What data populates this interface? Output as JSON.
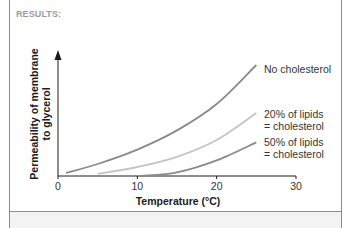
{
  "header": {
    "label": "RESULTS:"
  },
  "chart_data": {
    "type": "line",
    "title": "",
    "xlabel": "Temperature (°C)",
    "ylabel": "Permeability of membrane to glycerol",
    "ylabel_lines": [
      "Permeability of membrane",
      "to glycerol"
    ],
    "xlim": [
      0,
      30
    ],
    "ylim": [
      0,
      100
    ],
    "x_ticks": [
      0,
      10,
      20,
      30
    ],
    "y_ticks": [],
    "grid": false,
    "legend_position": "inline-right",
    "series": [
      {
        "name": "No cholesterol",
        "label_lines": [
          "No cholesterol"
        ],
        "color": "#8a8a8a",
        "x": [
          1,
          5,
          10,
          15,
          20,
          25
        ],
        "values": [
          2.5,
          10,
          22,
          38,
          60,
          92.5
        ]
      },
      {
        "name": "20% of lipids = cholesterol",
        "label_lines": [
          "20% of lipids",
          "= cholesterol"
        ],
        "color": "#c4c4c4",
        "x": [
          5,
          10,
          15,
          20,
          25
        ],
        "values": [
          1.7,
          7.5,
          16,
          30,
          52.5
        ]
      },
      {
        "name": "50% of lipids = cholesterol",
        "label_lines": [
          "50% of lipids",
          "= cholesterol"
        ],
        "color": "#8a8a8a",
        "x": [
          10.5,
          15,
          20,
          25
        ],
        "values": [
          0,
          3,
          13,
          28
        ]
      }
    ]
  }
}
